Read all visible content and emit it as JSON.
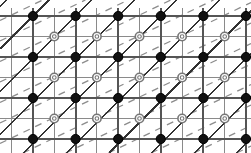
{
  "figure": {
    "width": 251,
    "height": 153,
    "background_color": "#ffffff"
  },
  "colors": {
    "background": "#ffffff",
    "grid_line": "#8a8a8a",
    "major_line": "#555555",
    "solid_diagonal": "#333333",
    "dashed_diagonal": "#8c8c8c",
    "filled_node_fill": "#111111",
    "filled_node_stroke": "#000000",
    "open_node_fill": "#ffffff",
    "open_node_stroke": "#777777"
  },
  "lattice": {
    "filled_node_x": [
      33,
      75.6,
      118.2,
      160.8,
      203.4,
      246
    ],
    "filled_node_y": [
      16,
      57,
      98,
      139
    ],
    "open_node_x": [
      54.3,
      96.9,
      139.5,
      182.1,
      224.7
    ],
    "open_node_y": [
      36.5,
      77.5,
      118.5
    ],
    "filled_node_radius": 4.6,
    "open_node_radius": 4.2,
    "open_node_inner_radius": 1.8,
    "cell_width": 42.6,
    "cell_height": 41,
    "filled_node_count": 24,
    "open_node_count": 15
  },
  "grid": {
    "minor_vertical_x": [
      11.7,
      33,
      54.3,
      75.6,
      96.9,
      118.2,
      139.5,
      160.8,
      182.1,
      203.4,
      224.7,
      246
    ],
    "minor_horizontal_y": [
      16,
      36.5,
      57,
      77.5,
      98,
      118.5,
      139
    ],
    "minor_width": 1.1,
    "major_width": 1.9,
    "visible": true
  },
  "solid_diagonals": {
    "slope": -1,
    "label": "primary diagonal family",
    "intercept_step": 42.6,
    "count": 11,
    "stroke_width": 1.5
  },
  "dashed_diagonals": {
    "slope": -0.48,
    "label": "secondary dashed family",
    "intercept_step": 20.5,
    "count": 14,
    "stroke_width": 1.3,
    "dash_pattern": "7 6"
  },
  "legend": {
    "filled_node_label": "filled lattice point",
    "open_node_label": "open lattice point",
    "solid_line_label": "solid diagonal",
    "dashed_line_label": "dashed diagonal"
  }
}
